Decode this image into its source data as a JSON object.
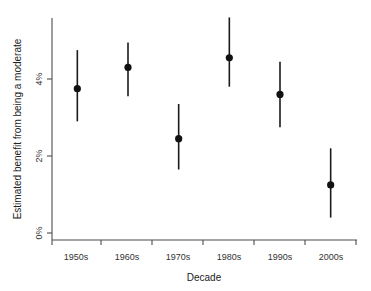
{
  "chart_data": {
    "type": "scatter",
    "title": "",
    "xlabel": "Decade",
    "ylabel": "Estimated benefit from being a moderate",
    "categories": [
      "1950s",
      "1960s",
      "1970s",
      "1980s",
      "1990s",
      "2000s"
    ],
    "values": [
      3.75,
      4.3,
      2.45,
      4.55,
      3.6,
      1.25
    ],
    "error_low": [
      2.9,
      3.55,
      1.65,
      3.8,
      2.75,
      0.4
    ],
    "error_high": [
      4.75,
      4.95,
      3.35,
      5.6,
      4.45,
      2.2
    ],
    "ylim": [
      -0.15,
      6.1
    ],
    "yticks": [
      0,
      2,
      4
    ],
    "ytick_labels": [
      "0%",
      "2%",
      "4%"
    ],
    "grid": false,
    "legend": null,
    "series": [
      {
        "name": "Estimated benefit from being a moderate",
        "points": [
          {
            "category": "1950s",
            "value": 3.75,
            "low": 2.9,
            "high": 4.75
          },
          {
            "category": "1960s",
            "value": 4.3,
            "low": 3.55,
            "high": 4.95
          },
          {
            "category": "1970s",
            "value": 2.45,
            "low": 1.65,
            "high": 3.35
          },
          {
            "category": "1980s",
            "value": 4.55,
            "low": 3.8,
            "high": 5.6
          },
          {
            "category": "1990s",
            "value": 3.6,
            "low": 2.75,
            "high": 4.45
          },
          {
            "category": "2000s",
            "value": 1.25,
            "low": 0.4,
            "high": 2.2
          }
        ]
      }
    ]
  },
  "axes": {
    "y_label": "Estimated benefit from being a moderate",
    "x_label": "Decade",
    "y_tick_0": "0%",
    "y_tick_1": "2%",
    "y_tick_2": "4%",
    "x_tick_0": "1950s",
    "x_tick_1": "1960s",
    "x_tick_2": "1970s",
    "x_tick_3": "1980s",
    "x_tick_4": "1990s",
    "x_tick_5": "2000s"
  },
  "colors": {
    "point": "#111111",
    "error_bar": "#1a1a1a",
    "axis": "#4d4d4d",
    "background": "#ffffff"
  }
}
